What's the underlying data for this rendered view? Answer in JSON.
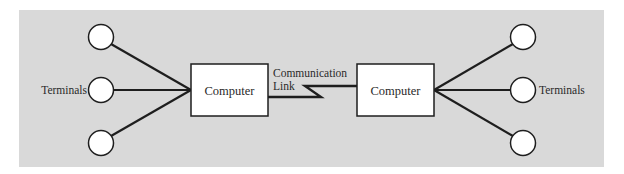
{
  "diagram": {
    "colors": {
      "panel": "#d9d9d9",
      "stroke": "#1e1e1e",
      "fill": "#ffffff",
      "text": "#2a2a2a"
    },
    "left": {
      "computer_label": "Computer",
      "terminals_label": "Terminals",
      "terminal_count": 3
    },
    "right": {
      "computer_label": "Computer",
      "terminals_label": "Terminals",
      "terminal_count": 3
    },
    "link": {
      "label_line1": "Communication",
      "label_line2": "Link"
    }
  }
}
